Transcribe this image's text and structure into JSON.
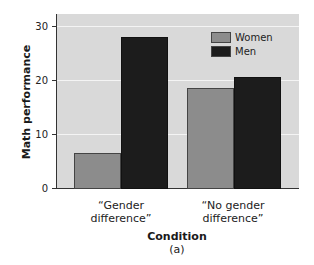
{
  "chart_data": {
    "type": "bar",
    "title": "",
    "xlabel": "Condition",
    "ylabel": "Math performance",
    "subtitle_label": "(a)",
    "categories": [
      "“Gender\ndifference”",
      "“No gender\ndifference”"
    ],
    "series": [
      {
        "name": "Women",
        "values": [
          6.5,
          18.5
        ],
        "color": "#8c8c8c"
      },
      {
        "name": "Men",
        "values": [
          28,
          20.5
        ],
        "color": "#1c1c1c"
      }
    ],
    "ylim": [
      0,
      32
    ],
    "yticks": [
      0,
      10,
      20,
      30
    ],
    "grid": true,
    "legend_position": "top-right",
    "background": "#d9d9d9"
  }
}
